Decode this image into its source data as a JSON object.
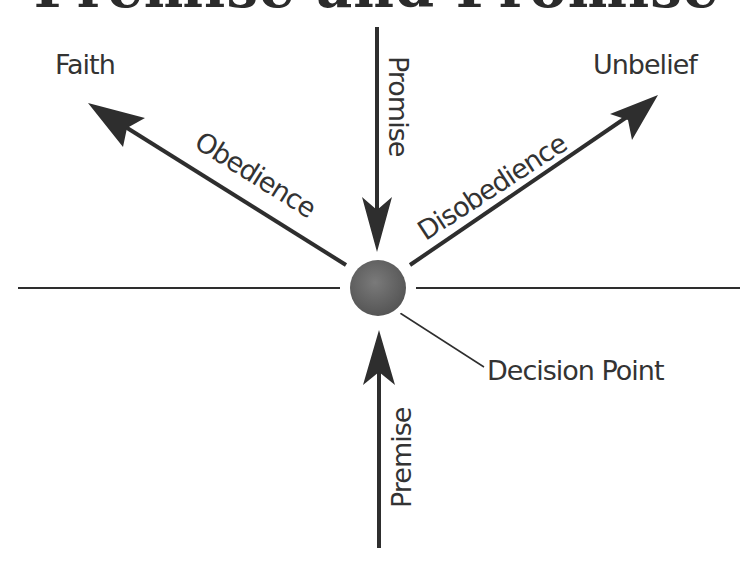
{
  "title": "Premise and Promise",
  "nodes": {
    "faith": "Faith",
    "unbelief": "Unbelief",
    "decision_point": "Decision Point"
  },
  "arrows": {
    "promise": "Promise",
    "premise": "Premise",
    "obedience": "Obedience",
    "disobedience": "Disobedience"
  },
  "colors": {
    "line": "#2e2e2e",
    "text": "#333333",
    "circle": "#6b6b6b",
    "background": "#ffffff"
  }
}
